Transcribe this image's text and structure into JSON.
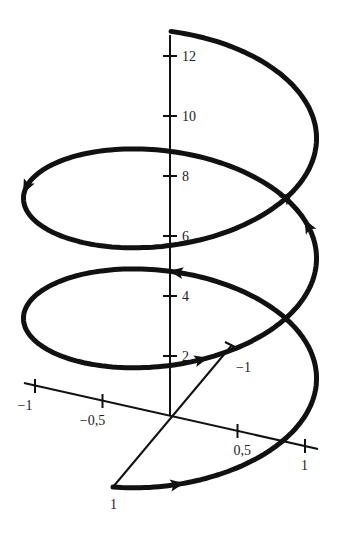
{
  "chart_data": {
    "type": "line",
    "title": "",
    "axes": {
      "z": {
        "ticks": [
          2,
          4,
          6,
          8,
          10,
          12
        ],
        "labels": [
          "2",
          "4",
          "6",
          "8",
          "10",
          "12"
        ]
      },
      "x": {
        "ticks": [
          -1,
          -0.5,
          0.5,
          1
        ],
        "labels": [
          "−1",
          "−0,5",
          "0,5",
          "1"
        ]
      },
      "y": {
        "ticks": [
          1,
          -1
        ],
        "labels": [
          "1",
          "−1"
        ]
      }
    },
    "series": [
      {
        "name": "helix",
        "parameter": "t",
        "t_range": [
          0,
          16.1
        ],
        "x": "cos t",
        "y": "sin t",
        "z": "2t/pi",
        "color": "#111111"
      }
    ],
    "arrows_at_t": [
      0.45,
      3.5,
      6.9,
      8.6,
      11.2,
      13.9
    ]
  }
}
